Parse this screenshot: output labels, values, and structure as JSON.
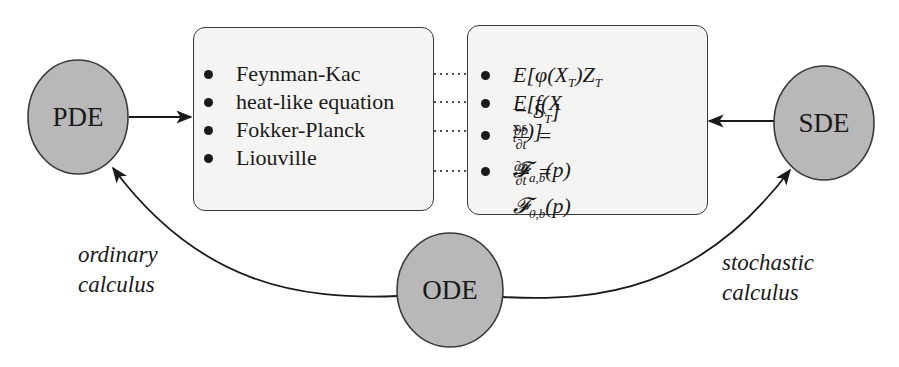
{
  "nodes": {
    "pde": {
      "label": "PDE"
    },
    "sde": {
      "label": "SDE"
    },
    "ode": {
      "label": "ODE"
    }
  },
  "left_box": {
    "items": [
      {
        "label": "Feynman-Kac"
      },
      {
        "label": "heat-like equation"
      },
      {
        "label": "Fokker-Planck"
      },
      {
        "label": "Liouville"
      }
    ]
  },
  "right_box": {
    "items": [
      {
        "label": "E[φ(X_T)Z_T − S_T]",
        "parts": {
          "a": "E[φ(X",
          "a_sub": "T",
          "b": ")Z",
          "b_sub": "T",
          "c": " − S",
          "c_sub": "T",
          "d": "]"
        }
      },
      {
        "label": "E[f(X_t^{x,s})]",
        "parts": {
          "a": "E[f(X",
          "sup": "x,s",
          "sub": "t",
          "b": ")]"
        }
      },
      {
        "label": "∂p/∂t = 𝓕_{a,b}(p)",
        "parts": {
          "num": "∂p",
          "den": "∂t",
          "eq": " = 𝓕",
          "sub": "a,b",
          "tail": "(p)"
        }
      },
      {
        "label": "∂p/∂t = 𝓕_{0,b}(p)",
        "parts": {
          "num": "∂p",
          "den": "∂t",
          "eq": " = 𝓕",
          "sub": "0,b",
          "tail": "(p)"
        }
      }
    ]
  },
  "edge_labels": {
    "left": {
      "line1": "ordinary",
      "line2": "calculus"
    },
    "right": {
      "line1": "stochastic",
      "line2": "calculus"
    }
  },
  "colors": {
    "node_fill": "#b8b8b8",
    "node_stroke": "#3a3a3a",
    "box_fill": "#f4f4f2",
    "stroke": "#1a1a1a"
  }
}
